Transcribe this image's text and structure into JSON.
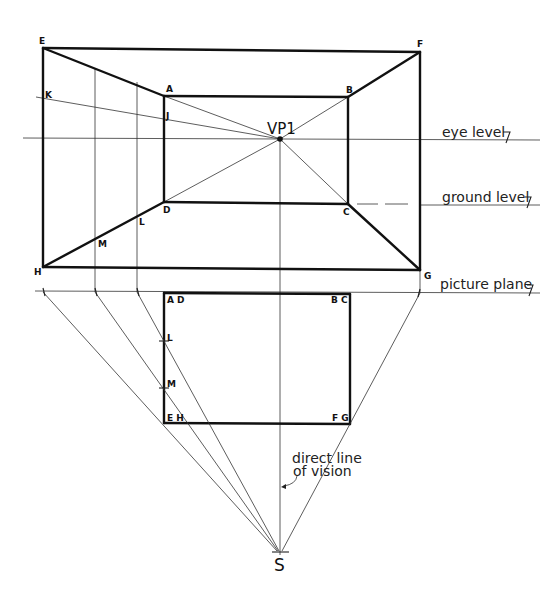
{
  "labels": {
    "vp": "VP1",
    "station_point": "S",
    "eye_level": "eye level",
    "ground_level": "ground level",
    "picture_plane": "picture plane",
    "direct_line_1": "direct line",
    "direct_line_2": "of vision"
  },
  "perspective_points": {
    "E": "E",
    "F": "F",
    "G": "G",
    "H": "H",
    "A": "A",
    "B": "B",
    "C": "C",
    "D": "D",
    "K": "K",
    "J": "J",
    "L": "L",
    "M": "M"
  },
  "plan_points": {
    "AD": "A D",
    "BC": "B C",
    "EH": "E H",
    "FG": "F G",
    "L": "L",
    "M": "M"
  }
}
